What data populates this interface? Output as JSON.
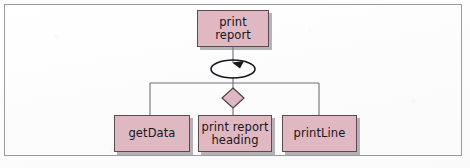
{
  "figure": {
    "kind": "structure-chart",
    "frame": {
      "border_color": "#9b9b9f",
      "background": "#fdfdfd"
    },
    "palette": {
      "module_fill": "#e0b8c2",
      "module_border": "#5b4a50",
      "module_shadow": "#787879",
      "connector": "#6f6f77",
      "loop_symbol": "#17171d",
      "text": "#16161e"
    }
  },
  "modules": {
    "root": {
      "id": "print-report",
      "label": "print\nreport",
      "level": "top"
    },
    "children": [
      {
        "id": "get-data",
        "label": "getData"
      },
      {
        "id": "print-heading",
        "label": "print report\nheading"
      },
      {
        "id": "print-line",
        "label": "printLine"
      }
    ]
  },
  "symbols": {
    "loop": {
      "name": "loop-symbol",
      "description": "circular arrow indicating repetition",
      "arrow_direction": "counter-clockwise"
    },
    "selection": {
      "name": "selection-diamond",
      "description": "diamond indicating conditional call"
    }
  }
}
